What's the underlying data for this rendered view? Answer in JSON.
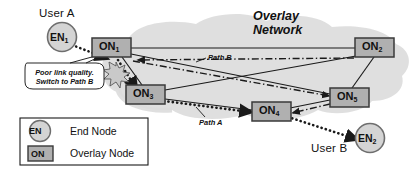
{
  "diagram": {
    "title": "Overlay Network",
    "title_line1": "Overlay",
    "title_line2": "Network",
    "colors": {
      "cloud": "#dcdcdc",
      "node_fill": "#b0b0b0",
      "node_stroke": "#3a3a3a",
      "end_node_fill": "#d4d4d4",
      "end_node_stroke": "#6e6e6e",
      "line": "#1a1a1a",
      "background": "#ffffff",
      "starburst": "#9a9a9a"
    }
  },
  "users": [
    {
      "name": "user-a",
      "label": "User A",
      "node": "EN",
      "subscript": "1"
    },
    {
      "name": "user-b",
      "label": "User B",
      "node": "EN",
      "subscript": "2"
    }
  ],
  "overlay_nodes": [
    {
      "id": "on1",
      "label": "ON",
      "subscript": "1"
    },
    {
      "id": "on2",
      "label": "ON",
      "subscript": "2"
    },
    {
      "id": "on3",
      "label": "ON",
      "subscript": "3"
    },
    {
      "id": "on4",
      "label": "ON",
      "subscript": "4"
    },
    {
      "id": "on5",
      "label": "ON",
      "subscript": "5"
    }
  ],
  "paths": [
    {
      "id": "path-a",
      "label": "Path A",
      "style": "dotted"
    },
    {
      "id": "path-b",
      "label": "Path B",
      "style": "dash-dot"
    }
  ],
  "callout": {
    "line1": "Poor link quality.",
    "line2": "Switch to Path B"
  },
  "legend": {
    "items": [
      {
        "symbol": "EN",
        "shape": "circle",
        "label": "End Node"
      },
      {
        "symbol": "ON",
        "shape": "square",
        "label": "Overlay Node"
      }
    ]
  }
}
